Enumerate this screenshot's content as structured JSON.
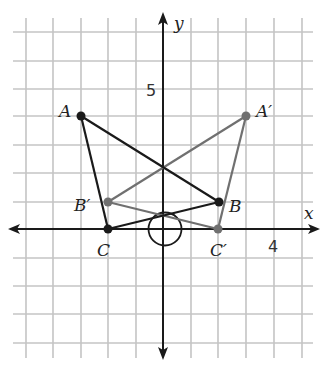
{
  "figure": {
    "axes": {
      "x_label": "x",
      "y_label": "y",
      "tick_labels": [
        {
          "axis": "y",
          "value": 5,
          "text": "5"
        },
        {
          "axis": "x",
          "value": 4,
          "text": "4"
        }
      ],
      "grid_x_range": [
        -5,
        5
      ],
      "grid_y_range": [
        -4,
        7
      ]
    },
    "colors": {
      "grid": "#c4c4c4",
      "axis": "#1a1a1a",
      "original": "#1a1a1a",
      "image": "#707070"
    },
    "triangle_original": {
      "name": "ABC",
      "points": [
        {
          "label": "A",
          "x": -3,
          "y": 4
        },
        {
          "label": "B",
          "x": 2,
          "y": 1
        },
        {
          "label": "C",
          "x": -2,
          "y": 0
        }
      ]
    },
    "triangle_image": {
      "name": "A'B'C'",
      "points": [
        {
          "label": "A′",
          "x": 3,
          "y": 4
        },
        {
          "label": "B′",
          "x": -2,
          "y": 1
        },
        {
          "label": "C′",
          "x": 2,
          "y": 0
        }
      ]
    },
    "origin_circle": {
      "cx": 0,
      "cy": 0,
      "r": 0.6
    }
  }
}
